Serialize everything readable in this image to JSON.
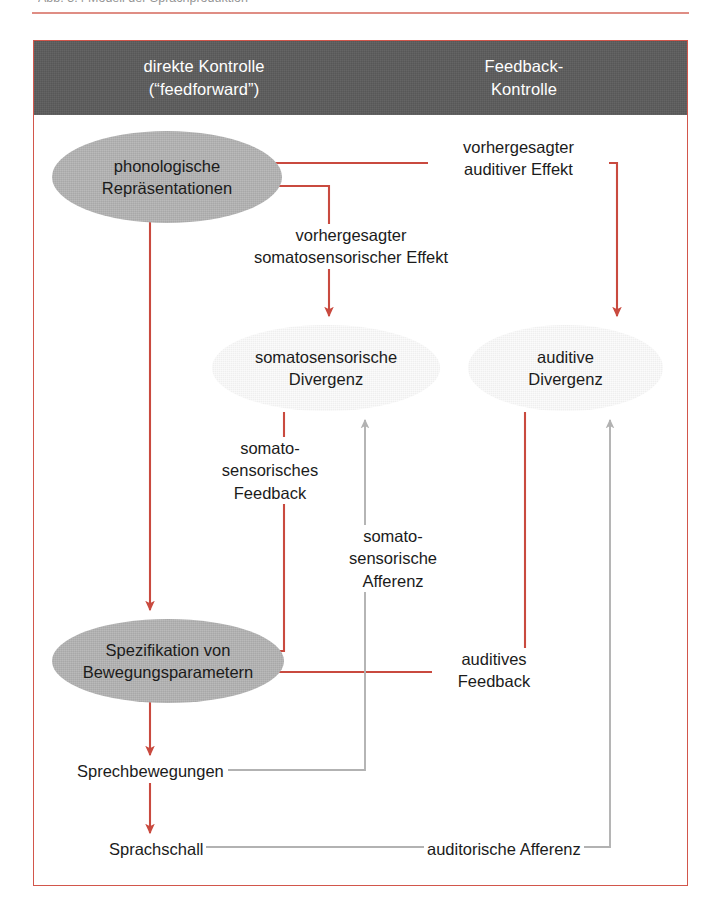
{
  "page": {
    "caption_partial": "Abb. 3.4  Modell der Sprachproduktion"
  },
  "figure": {
    "header": {
      "left_column": [
        "direkte Kontrolle",
        "(“feedforward”)"
      ],
      "right_column": [
        "Feedback-",
        "Kontrolle"
      ]
    },
    "nodes": [
      {
        "id": "phonologische-repraesentationen",
        "lines": [
          "phonologische",
          "Repräsentationen"
        ],
        "fill": "#a8a8a8",
        "shade": "dark"
      },
      {
        "id": "somatosensorische-divergenz",
        "lines": [
          "somatosensorische",
          "Divergenz"
        ],
        "fill": "#efefef",
        "shade": "light"
      },
      {
        "id": "auditive-divergenz",
        "lines": [
          "auditive",
          "Divergenz"
        ],
        "fill": "#efefef",
        "shade": "light"
      },
      {
        "id": "spezifikation-bewegungsparameter",
        "lines": [
          "Spezifikation von",
          "Bewegungsparametern"
        ],
        "fill": "#a8a8a8",
        "shade": "dark"
      }
    ],
    "edge_labels": [
      {
        "id": "vorhergesagter-auditiver-effekt",
        "lines": [
          "vorhergesagter",
          "auditiver Effekt"
        ]
      },
      {
        "id": "vorhergesagter-somatosensorischer-effekt",
        "lines": [
          "vorhergesagter",
          "somatosensorischer Effekt"
        ]
      },
      {
        "id": "somatosensorisches-feedback",
        "lines": [
          "somato-",
          "sensorisches",
          "Feedback"
        ]
      },
      {
        "id": "somatosensorische-afferenz",
        "lines": [
          "somato-",
          "sensorische",
          "Afferenz"
        ]
      },
      {
        "id": "auditives-feedback",
        "lines": [
          "auditives",
          "Feedback"
        ]
      },
      {
        "id": "auditorische-afferenz",
        "lines": [
          "auditorische Afferenz"
        ]
      }
    ],
    "terminal_labels": [
      {
        "id": "sprechbewegungen",
        "text": "Sprechbewegungen"
      },
      {
        "id": "sprachschall",
        "text": "Sprachschall"
      }
    ],
    "colors": {
      "frame": "#d2564b",
      "header_band": "#575757",
      "feedforward_arrow": "#d2564b",
      "afferent_arrow": "#aeaeae",
      "node_dark": "#a8a8a8",
      "node_light": "#efefef",
      "text": "#1b1b1b",
      "header_text": "#ffffff"
    }
  }
}
